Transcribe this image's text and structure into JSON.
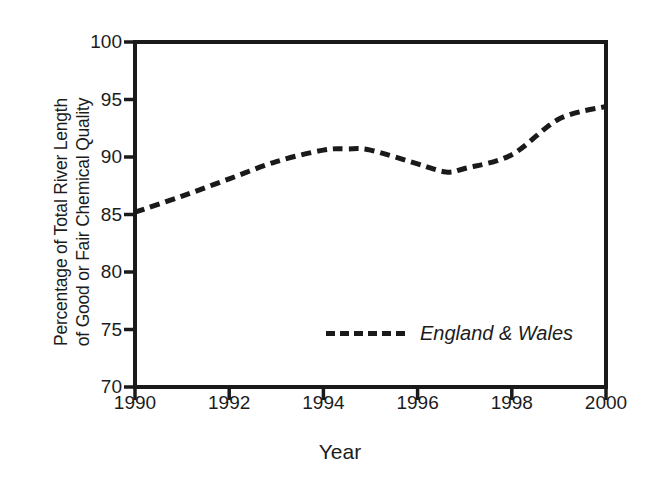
{
  "chart_data": {
    "type": "line",
    "title": "",
    "xlabel": "Year",
    "ylabel_line1": "Percentage of Total River Length",
    "ylabel_line2": "of Good or Fair Chemical Quality",
    "xlim": [
      1990,
      2000
    ],
    "ylim": [
      70,
      100
    ],
    "xticks": [
      "1990",
      "1992",
      "1994",
      "1996",
      "1998",
      "2000"
    ],
    "xtick_values": [
      1990,
      1992,
      1994,
      1996,
      1998,
      2000
    ],
    "yticks": [
      "70",
      "75",
      "80",
      "85",
      "90",
      "95",
      "100"
    ],
    "ytick_values": [
      70,
      75,
      80,
      85,
      90,
      95,
      100
    ],
    "grid": false,
    "legend_position": "inside-lower-right",
    "line_style": "dashed",
    "line_color": "#1a1a1a",
    "series": [
      {
        "name": "England & Wales",
        "x": [
          1990,
          1991,
          1992,
          1993,
          1994,
          1994.5,
          1995,
          1996,
          1996.6,
          1997,
          1998,
          1999,
          2000
        ],
        "values": [
          85.2,
          86.6,
          88.1,
          89.6,
          90.6,
          90.7,
          90.6,
          89.4,
          88.7,
          89.0,
          90.2,
          93.3,
          94.4
        ]
      }
    ]
  },
  "legend": {
    "entries": [
      {
        "label": "England & Wales",
        "swatch": "dashed-line-swatch"
      }
    ]
  },
  "axes": {
    "x_title": "Year",
    "y_title_line1": "Percentage of Total River Length",
    "y_title_line2": "of Good or Fair Chemical Quality"
  }
}
